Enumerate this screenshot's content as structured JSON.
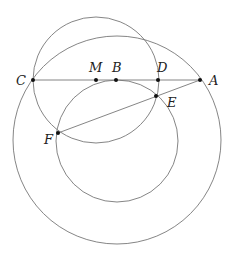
{
  "diagram": {
    "title": "",
    "colors": {
      "stroke": "#777777",
      "point": "#111111",
      "label": "#222222"
    },
    "points": [
      {
        "name": "C",
        "x": 33,
        "y": 80,
        "label_dx": -17,
        "label_dy": 5
      },
      {
        "name": "M",
        "x": 96,
        "y": 80,
        "label_dx": -6,
        "label_dy": -8
      },
      {
        "name": "B",
        "x": 116,
        "y": 80,
        "label_dx": -3,
        "label_dy": -8
      },
      {
        "name": "D",
        "x": 158,
        "y": 80,
        "label_dx": -2,
        "label_dy": -8
      },
      {
        "name": "A",
        "x": 200,
        "y": 80,
        "label_dx": 9,
        "label_dy": 5
      },
      {
        "name": "E",
        "x": 156,
        "y": 96,
        "label_dx": 5,
        "label_dy": 12
      },
      {
        "name": "F",
        "x": 58,
        "y": 133,
        "label_dx": -14,
        "label_dy": 11
      }
    ],
    "labels": {
      "C": "C",
      "M": "M",
      "B": "B",
      "D": "D",
      "A": "A",
      "E": "E",
      "F": "F"
    },
    "segments": [
      {
        "from": "C",
        "to": "A"
      },
      {
        "from": "A",
        "to": "F"
      }
    ],
    "circles": [
      {
        "name": "circle-centered-M",
        "cx": 96,
        "cy": 80,
        "r": 63
      },
      {
        "name": "inner-circle-through-B-E-F",
        "cx": 117,
        "cy": 141,
        "r": 61
      },
      {
        "name": "large-circle-through-C-A",
        "cx": 117,
        "cy": 140,
        "r": 104
      }
    ]
  }
}
